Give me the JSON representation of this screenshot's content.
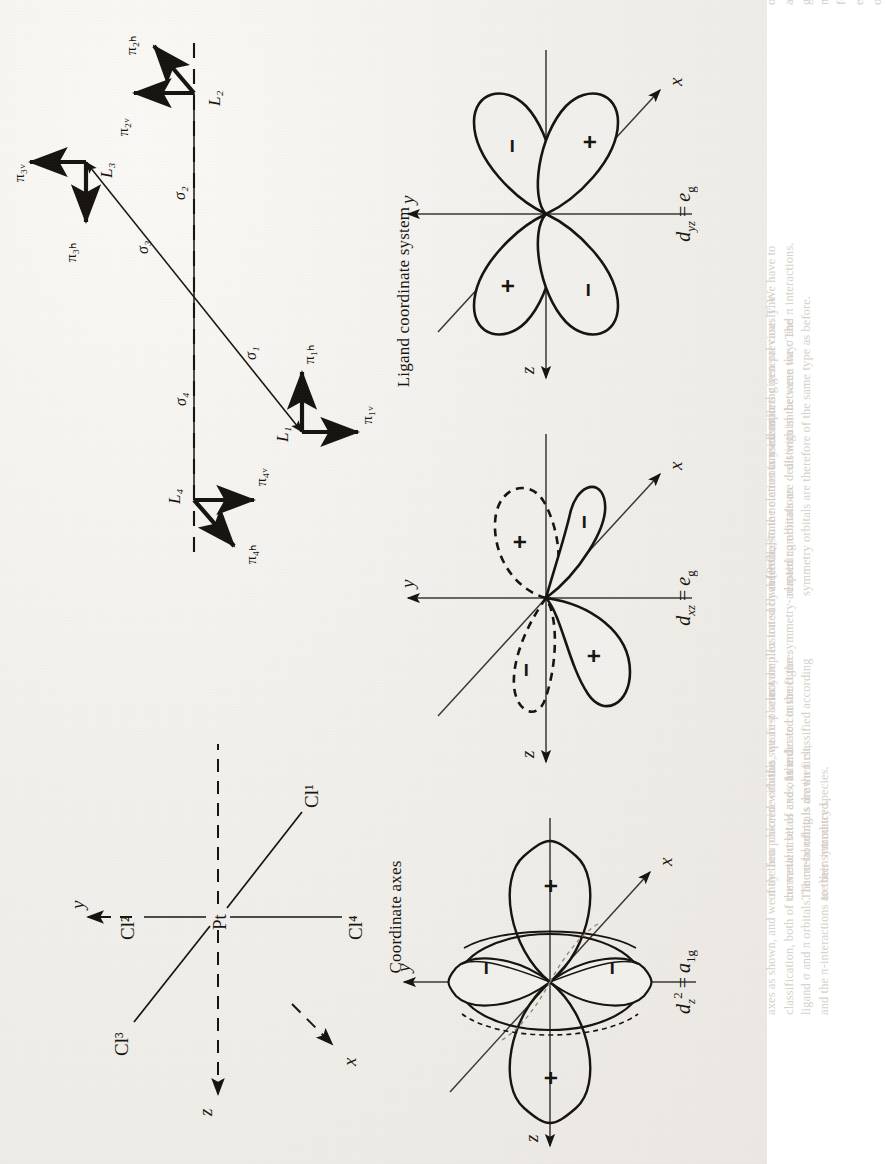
{
  "page": {
    "orientation": "rotated-90-ccw",
    "background_color": "#f1efeb",
    "ink_color": "#17140f"
  },
  "figures": [
    {
      "id": "ligand-coordinate-system",
      "caption": "Ligand coordinate system",
      "ligands": [
        "L1",
        "L2",
        "L3",
        "L4"
      ],
      "sigma_labels": [
        "σ₁",
        "σ₂",
        "σ₃",
        "σ₄"
      ],
      "pi_labels": [
        "π₁ᵥ",
        "π₁ₕ",
        "π₂ᵥ",
        "π₂ₕ",
        "π₃ᵥ",
        "π₃ₕ",
        "π₄ᵥ",
        "π₄ₕ"
      ],
      "l1": "L₁",
      "l2": "L₂",
      "l3": "L₃",
      "l4": "L₄",
      "s1": "σ₁",
      "s2": "σ₂",
      "s3": "σ₃",
      "s4": "σ₄",
      "p1v": "π₁ᵥ",
      "p1h": "π₁ₕ",
      "p2v": "π₂ᵥ",
      "p2h": "π₂ₕ",
      "p3v": "π₃ᵥ",
      "p3h": "π₃ₕ",
      "p4v": "π₄ᵥ",
      "p4h": "π₄ₕ"
    },
    {
      "id": "coordinate-axes",
      "caption": "Coordinate axes",
      "center_atom": "Pt",
      "ligand_labels": [
        "Cl¹",
        "Cl²",
        "Cl³",
        "Cl⁴"
      ],
      "axis_labels": [
        "x",
        "y",
        "z"
      ],
      "cl1": "Cl¹",
      "cl2": "Cl²",
      "cl3": "Cl³",
      "cl4": "Cl⁴",
      "ax_x": "x",
      "ax_y": "y",
      "ax_z": "z"
    },
    {
      "id": "orbital-dz2",
      "label": "d₂² = a₁g",
      "label_parts": {
        "d": "d",
        "sub": "z",
        "sup": "2",
        "eq": "=",
        "sym": "a",
        "symsub": "1g"
      },
      "axis_labels": [
        "x",
        "y",
        "z"
      ],
      "ax_x": "x",
      "ax_y": "y",
      "ax_z": "z",
      "lobe_signs": [
        "+",
        "+",
        "−",
        "−"
      ],
      "plus": "+",
      "minus": "−",
      "orbital_type": "dz2"
    },
    {
      "id": "orbital-dxz",
      "label": "dₓₓ = e_g",
      "label_parts": {
        "d": "d",
        "sub": "xz",
        "eq": "=",
        "sym": "e",
        "symsub": "g"
      },
      "axis_labels": [
        "x",
        "y",
        "z"
      ],
      "ax_x": "x",
      "ax_y": "y",
      "ax_z": "z",
      "lobe_signs": [
        "−",
        "+",
        "+",
        "−"
      ],
      "plus": "+",
      "minus": "−",
      "orbital_type": "dxz"
    },
    {
      "id": "orbital-dyz",
      "label": "d_yz = e_g",
      "label_parts": {
        "d": "d",
        "sub": "yz",
        "eq": "=",
        "sym": "e",
        "symsub": "g"
      },
      "axis_labels": [
        "x",
        "y",
        "z"
      ],
      "ax_x": "x",
      "ax_y": "y",
      "ax_z": "z",
      "lobe_signs": [
        "+",
        "−",
        "−",
        "+"
      ],
      "plus": "+",
      "minus": "−",
      "orbital_type": "dyz"
    }
  ],
  "ghost_text": {
    "line1": "of the group. In addition the (ns) and the (np) atomic orbit-\nals of the metal are capable of bonding, in the manner of the\ngroup. Here the (n-1)d, (ns) and (np) orbitals of the\nmetal are used, together with the ligand orbitals. The\nformulation is given in Fig. 6, and the corresponding\nenergy level diagram is presented in Fig. 7. Since some\nof these considerations are merely qualitative.",
    "line2": "considerations given previously. We have to\ndistinguish between the σ and π interactions.",
    "line3": "where the same notation is used as in the general case. The\nremaining orbitals are dealt with in the same way. The\nsymmetry orbitals are therefore of the same type as before.",
    "line4": "may be illustrated by reference to the elementary example",
    "line5": "of a square-planar complex ion such as [PtCl₄]²⁻.\nIn order to construct the symmetry-adapted combinations",
    "line6": "of the four chlorine orbitals, we first select a\nconvenient set of axes, as indicated in the figure.\nThe metal orbitals are then classified according\nto their symmetry species.",
    "line7": "axes as shown, and we may then proceed with the\nclassification, both of the metal orbitals and of the\nligand σ and π orbitals. The σ-bonding is drawn first,\nand the π-interactions are then introduced."
  }
}
